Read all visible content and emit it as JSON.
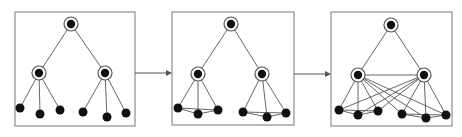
{
  "diagram": {
    "colors": {
      "stroke": "#555555",
      "node": "#111111",
      "frame": "#777777",
      "background": "#ffffff"
    },
    "panels": [
      {
        "id": "panel-1",
        "frame": [
          15,
          12,
          120,
          114
        ],
        "root": [
          71,
          24
        ],
        "mids": [
          [
            39,
            73
          ],
          [
            105,
            73
          ]
        ],
        "leaves": [
          [
            20,
            108
          ],
          [
            40,
            114
          ],
          [
            60,
            110
          ],
          [
            83,
            112
          ],
          [
            107,
            117
          ],
          [
            126,
            113
          ]
        ],
        "leaf_links": [],
        "cross_links": false,
        "mid_link": false
      },
      {
        "id": "panel-2",
        "frame": [
          172,
          12,
          122,
          113
        ],
        "root": [
          231,
          24
        ],
        "mids": [
          [
            198,
            74
          ],
          [
            262,
            74
          ]
        ],
        "leaves": [
          [
            178,
            108
          ],
          [
            198,
            114
          ],
          [
            218,
            110
          ],
          [
            243,
            112
          ],
          [
            267,
            117
          ],
          [
            286,
            113
          ]
        ],
        "leaf_links": [
          [
            0,
            1
          ],
          [
            1,
            2
          ],
          [
            0,
            2
          ],
          [
            3,
            4
          ],
          [
            4,
            5
          ],
          [
            3,
            5
          ]
        ],
        "cross_links": false,
        "mid_link": false
      },
      {
        "id": "panel-3",
        "frame": [
          331,
          12,
          121,
          114
        ],
        "root": [
          391,
          25
        ],
        "mids": [
          [
            358,
            75
          ],
          [
            424,
            75
          ]
        ],
        "leaves": [
          [
            339,
            110
          ],
          [
            358,
            115
          ],
          [
            378,
            111
          ],
          [
            402,
            114
          ],
          [
            426,
            118
          ],
          [
            446,
            115
          ]
        ],
        "leaf_links": [
          [
            0,
            1
          ],
          [
            1,
            2
          ],
          [
            0,
            2
          ],
          [
            3,
            4
          ],
          [
            4,
            5
          ],
          [
            3,
            5
          ]
        ],
        "cross_links": true,
        "mid_link": true
      }
    ],
    "arrows": [
      {
        "from": [
          135,
          73
        ],
        "to": [
          172,
          73
        ]
      },
      {
        "from": [
          294,
          74
        ],
        "to": [
          331,
          74
        ]
      }
    ]
  }
}
